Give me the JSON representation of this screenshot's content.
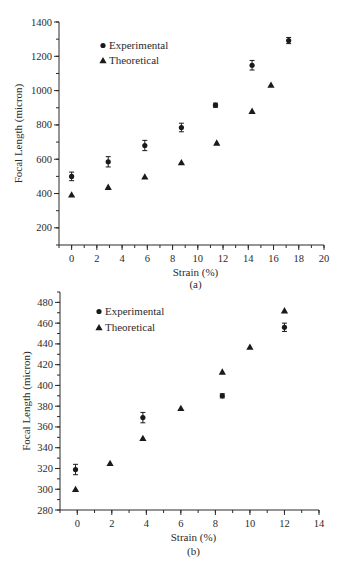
{
  "chart_data": [
    {
      "type": "scatter",
      "panel_label": "(a)",
      "title": "",
      "xlabel": "Strain (%)",
      "ylabel": "Focal Length (micron)",
      "xlim": [
        -1,
        20
      ],
      "ylim": [
        100,
        1400
      ],
      "xticks": [
        0,
        2,
        4,
        6,
        8,
        10,
        12,
        14,
        16,
        18,
        20
      ],
      "yticks": [
        200,
        400,
        600,
        800,
        1000,
        1200,
        1400
      ],
      "grid": false,
      "legend_position": "upper left",
      "series": [
        {
          "name": "Experimental",
          "marker": "circle",
          "x": [
            0,
            2.9,
            5.8,
            8.7,
            11.4,
            14.3,
            17.2
          ],
          "y": [
            500,
            585,
            680,
            785,
            915,
            1148,
            1292
          ],
          "error": [
            25,
            30,
            30,
            25,
            12,
            28,
            18
          ]
        },
        {
          "name": "Theoretical",
          "marker": "triangle",
          "x": [
            0,
            2.9,
            5.8,
            8.7,
            11.5,
            14.3,
            15.8
          ],
          "y": [
            392,
            437,
            497,
            580,
            695,
            880,
            1032
          ]
        }
      ]
    },
    {
      "type": "scatter",
      "panel_label": "(b)",
      "title": "",
      "xlabel": "Strain (%)",
      "ylabel": "Focal Length (micron)",
      "xlim": [
        -1,
        14
      ],
      "ylim": [
        280,
        490
      ],
      "xticks": [
        0,
        2,
        4,
        6,
        8,
        10,
        12,
        14
      ],
      "yticks": [
        280,
        300,
        320,
        340,
        360,
        380,
        400,
        420,
        440,
        460,
        480
      ],
      "grid": false,
      "legend_position": "upper left",
      "series": [
        {
          "name": "Experimental",
          "marker": "circle",
          "x": [
            -0.1,
            3.8,
            8.4,
            12
          ],
          "y": [
            319,
            369,
            390,
            456
          ],
          "error": [
            5,
            5,
            2,
            4
          ]
        },
        {
          "name": "Theoretical",
          "marker": "triangle",
          "x": [
            -0.1,
            1.9,
            3.8,
            6,
            8.4,
            10,
            12
          ],
          "y": [
            300,
            325,
            349,
            378,
            413,
            437,
            472
          ]
        }
      ]
    }
  ]
}
